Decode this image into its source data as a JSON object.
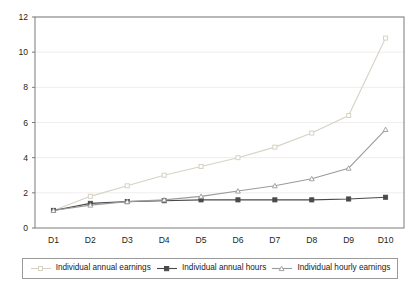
{
  "chart_data": {
    "type": "line",
    "title": "",
    "subtitle": "",
    "xlabel": "",
    "ylabel": "",
    "categories": [
      "D1",
      "D2",
      "D3",
      "D4",
      "D5",
      "D6",
      "D7",
      "D8",
      "D9",
      "D10"
    ],
    "xticklabels": [
      "D1",
      "D2",
      "D3",
      "D4",
      "D5",
      "D6",
      "D7",
      "D8",
      "D9",
      "D10"
    ],
    "yticklabels": [
      "0",
      "2",
      "4",
      "6",
      "8",
      "10",
      "12"
    ],
    "yticks": [
      0,
      2,
      4,
      6,
      8,
      10,
      12
    ],
    "ylim": [
      0,
      12
    ],
    "grid": "horizontal",
    "legend_position": "bottom",
    "series": [
      {
        "name": "Individual annual earnings",
        "color": "#d6d2c4",
        "marker": "square-open",
        "values": [
          1.0,
          1.8,
          2.4,
          3.0,
          3.5,
          4.0,
          4.6,
          5.4,
          6.4,
          10.8
        ]
      },
      {
        "name": "Individual annual hours",
        "color": "#4a4a4a",
        "marker": "square-filled",
        "values": [
          1.0,
          1.4,
          1.5,
          1.55,
          1.6,
          1.6,
          1.6,
          1.6,
          1.65,
          1.75
        ]
      },
      {
        "name": "Individual hourly earnings",
        "color": "#9b9b9b",
        "marker": "triangle",
        "values": [
          1.0,
          1.3,
          1.5,
          1.6,
          1.8,
          2.1,
          2.4,
          2.8,
          3.4,
          5.6
        ]
      }
    ]
  },
  "legend": {
    "entries": [
      {
        "label": "Individual annual earnings"
      },
      {
        "label": "Individual annual hours"
      },
      {
        "label": "Individual hourly earnings"
      }
    ]
  },
  "colors": {
    "axis": "#7a7a7a",
    "gridline": "#f0eeea",
    "legend_border": "#9a9a9a",
    "text": "#231f20",
    "series_annual_earnings": "#d6d2c4",
    "series_annual_hours": "#4a4a4a",
    "series_hourly_earnings": "#9b9b9b"
  }
}
